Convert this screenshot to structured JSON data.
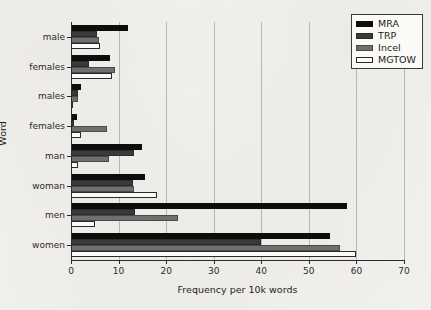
{
  "chart_data": {
    "type": "bar",
    "orientation": "horizontal",
    "title": "",
    "xlabel": "Frequency per 10k words",
    "ylabel": "Word",
    "xlim": [
      0,
      70
    ],
    "xticks": [
      0,
      10,
      20,
      30,
      40,
      50,
      60,
      70
    ],
    "xtick_labels": [
      "0",
      "10",
      "20",
      "30",
      "40",
      "50",
      "60",
      "70"
    ],
    "grid": "vertical",
    "legend_position": "upper right",
    "categories": [
      "male",
      "females",
      "males",
      "females",
      "man",
      "woman",
      "men",
      "women"
    ],
    "series": [
      {
        "name": "MRA",
        "color": "#0d0d0d",
        "values": [
          12.0,
          8.2,
          2.0,
          1.3,
          15.0,
          15.5,
          58.0,
          54.5
        ]
      },
      {
        "name": "TRP",
        "color": "#3a3a3a",
        "values": [
          5.5,
          3.8,
          1.5,
          0.7,
          13.3,
          13.0,
          13.5,
          40.0
        ]
      },
      {
        "name": "Incel",
        "color": "#6f6f6f",
        "values": [
          5.8,
          9.3,
          1.5,
          7.5,
          8.0,
          13.3,
          22.5,
          56.5
        ]
      },
      {
        "name": "MGTOW",
        "color": "#fbfaf7",
        "values": [
          6.0,
          8.7,
          0.3,
          2.0,
          1.5,
          18.0,
          5.0,
          60.0
        ]
      }
    ]
  },
  "legend": {
    "items": [
      {
        "label": "MRA"
      },
      {
        "label": "TRP"
      },
      {
        "label": "Incel"
      },
      {
        "label": "MGTOW"
      }
    ]
  }
}
